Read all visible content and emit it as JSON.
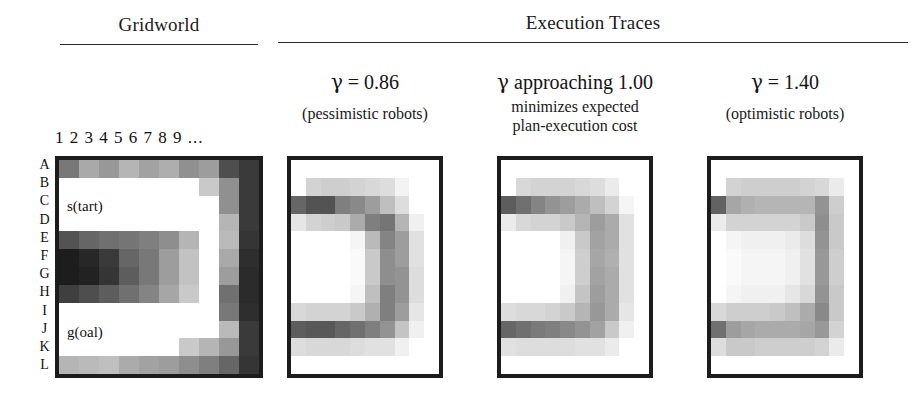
{
  "headings": {
    "gridworld": "Gridworld",
    "traces": "Execution Traces"
  },
  "gridworld": {
    "column_header": "1 2 3 4 5 6 7 8 9 ...",
    "row_labels": [
      "A",
      "B",
      "C",
      "D",
      "E",
      "F",
      "G",
      "H",
      "I",
      "J",
      "K",
      "L"
    ],
    "start_label": "s(tart)",
    "goal_label": "g(oal)",
    "columns": 10,
    "rows": 12,
    "grid": [
      [
        0.55,
        0.35,
        0.42,
        0.3,
        0.38,
        0.33,
        0.45,
        0.4,
        0.72,
        0.8
      ],
      [
        0.0,
        0.0,
        0.0,
        0.0,
        0.0,
        0.0,
        0.0,
        0.22,
        0.45,
        0.8
      ],
      [
        0.0,
        0.0,
        0.0,
        0.0,
        0.0,
        0.0,
        0.0,
        0.0,
        0.45,
        0.8
      ],
      [
        0.0,
        0.0,
        0.0,
        0.0,
        0.0,
        0.0,
        0.0,
        0.0,
        0.3,
        0.8
      ],
      [
        0.7,
        0.62,
        0.58,
        0.56,
        0.52,
        0.46,
        0.3,
        0.0,
        0.28,
        0.82
      ],
      [
        0.92,
        0.88,
        0.8,
        0.62,
        0.55,
        0.4,
        0.25,
        0.0,
        0.35,
        0.85
      ],
      [
        0.92,
        0.9,
        0.82,
        0.66,
        0.55,
        0.4,
        0.25,
        0.0,
        0.4,
        0.86
      ],
      [
        0.78,
        0.72,
        0.66,
        0.58,
        0.5,
        0.36,
        0.22,
        0.0,
        0.58,
        0.86
      ],
      [
        0.0,
        0.0,
        0.0,
        0.0,
        0.0,
        0.0,
        0.0,
        0.0,
        0.55,
        0.85
      ],
      [
        0.0,
        0.0,
        0.0,
        0.0,
        0.0,
        0.0,
        0.0,
        0.0,
        0.28,
        0.8
      ],
      [
        0.0,
        0.0,
        0.0,
        0.0,
        0.0,
        0.0,
        0.22,
        0.3,
        0.42,
        0.8
      ],
      [
        0.3,
        0.28,
        0.26,
        0.34,
        0.38,
        0.4,
        0.46,
        0.52,
        0.62,
        0.82
      ]
    ]
  },
  "traces": [
    {
      "gamma_symbol": "γ",
      "gamma_text": " =  0.86",
      "caption": "(pessimistic robots)",
      "columns": 10,
      "rows": 12,
      "grid": [
        [
          0.0,
          0.0,
          0.0,
          0.0,
          0.0,
          0.0,
          0.0,
          0.0,
          0.0,
          0.0
        ],
        [
          0.0,
          0.18,
          0.2,
          0.2,
          0.18,
          0.16,
          0.14,
          0.05,
          0.0,
          0.0
        ],
        [
          0.62,
          0.7,
          0.7,
          0.52,
          0.48,
          0.4,
          0.26,
          0.14,
          0.0,
          0.0
        ],
        [
          0.1,
          0.18,
          0.2,
          0.22,
          0.34,
          0.52,
          0.56,
          0.3,
          0.06,
          0.0
        ],
        [
          0.0,
          0.0,
          0.0,
          0.0,
          0.04,
          0.28,
          0.5,
          0.4,
          0.12,
          0.0
        ],
        [
          0.0,
          0.0,
          0.0,
          0.0,
          0.02,
          0.22,
          0.46,
          0.4,
          0.12,
          0.0
        ],
        [
          0.0,
          0.0,
          0.0,
          0.0,
          0.02,
          0.22,
          0.46,
          0.44,
          0.14,
          0.0
        ],
        [
          0.0,
          0.0,
          0.0,
          0.0,
          0.04,
          0.26,
          0.52,
          0.44,
          0.14,
          0.0
        ],
        [
          0.16,
          0.18,
          0.18,
          0.18,
          0.22,
          0.32,
          0.52,
          0.4,
          0.1,
          0.0
        ],
        [
          0.66,
          0.68,
          0.68,
          0.62,
          0.58,
          0.52,
          0.44,
          0.24,
          0.06,
          0.0
        ],
        [
          0.14,
          0.16,
          0.16,
          0.16,
          0.14,
          0.12,
          0.12,
          0.06,
          0.0,
          0.0
        ],
        [
          0.0,
          0.0,
          0.0,
          0.0,
          0.0,
          0.0,
          0.0,
          0.0,
          0.0,
          0.0
        ]
      ]
    },
    {
      "gamma_symbol": "γ",
      "gamma_text": " approaching 1.00",
      "caption_line1": "minimizes expected",
      "caption_line2": "plan-execution cost",
      "columns": 10,
      "rows": 12,
      "grid": [
        [
          0.0,
          0.0,
          0.0,
          0.0,
          0.0,
          0.0,
          0.0,
          0.0,
          0.0,
          0.0
        ],
        [
          0.0,
          0.16,
          0.18,
          0.18,
          0.18,
          0.16,
          0.14,
          0.08,
          0.0,
          0.0
        ],
        [
          0.66,
          0.58,
          0.5,
          0.44,
          0.4,
          0.34,
          0.26,
          0.18,
          0.04,
          0.0
        ],
        [
          0.08,
          0.16,
          0.18,
          0.18,
          0.22,
          0.3,
          0.4,
          0.34,
          0.12,
          0.0
        ],
        [
          0.0,
          0.0,
          0.0,
          0.0,
          0.06,
          0.22,
          0.38,
          0.34,
          0.12,
          0.0
        ],
        [
          0.0,
          0.0,
          0.0,
          0.0,
          0.04,
          0.2,
          0.36,
          0.32,
          0.12,
          0.0
        ],
        [
          0.0,
          0.0,
          0.0,
          0.0,
          0.04,
          0.2,
          0.38,
          0.34,
          0.12,
          0.0
        ],
        [
          0.0,
          0.0,
          0.0,
          0.0,
          0.06,
          0.24,
          0.4,
          0.34,
          0.12,
          0.0
        ],
        [
          0.14,
          0.16,
          0.16,
          0.18,
          0.22,
          0.3,
          0.42,
          0.34,
          0.1,
          0.0
        ],
        [
          0.62,
          0.58,
          0.54,
          0.52,
          0.48,
          0.44,
          0.38,
          0.22,
          0.06,
          0.0
        ],
        [
          0.12,
          0.14,
          0.14,
          0.14,
          0.14,
          0.12,
          0.12,
          0.08,
          0.0,
          0.0
        ],
        [
          0.0,
          0.0,
          0.0,
          0.0,
          0.0,
          0.0,
          0.0,
          0.0,
          0.0,
          0.0
        ]
      ]
    },
    {
      "gamma_symbol": "γ",
      "gamma_text": " =  1.40",
      "caption": "(optimistic robots)",
      "columns": 10,
      "rows": 12,
      "grid": [
        [
          0.0,
          0.0,
          0.0,
          0.0,
          0.0,
          0.0,
          0.0,
          0.0,
          0.0,
          0.0
        ],
        [
          0.0,
          0.18,
          0.2,
          0.2,
          0.2,
          0.2,
          0.18,
          0.16,
          0.08,
          0.0
        ],
        [
          0.64,
          0.36,
          0.32,
          0.3,
          0.3,
          0.3,
          0.3,
          0.44,
          0.2,
          0.0
        ],
        [
          0.08,
          0.18,
          0.18,
          0.18,
          0.18,
          0.18,
          0.22,
          0.46,
          0.22,
          0.0
        ],
        [
          0.0,
          0.04,
          0.06,
          0.06,
          0.06,
          0.08,
          0.14,
          0.44,
          0.22,
          0.0
        ],
        [
          0.0,
          0.02,
          0.04,
          0.04,
          0.04,
          0.06,
          0.12,
          0.42,
          0.2,
          0.0
        ],
        [
          0.0,
          0.02,
          0.04,
          0.04,
          0.04,
          0.06,
          0.12,
          0.42,
          0.2,
          0.0
        ],
        [
          0.0,
          0.04,
          0.06,
          0.06,
          0.06,
          0.1,
          0.16,
          0.44,
          0.22,
          0.0
        ],
        [
          0.16,
          0.2,
          0.2,
          0.2,
          0.22,
          0.26,
          0.34,
          0.48,
          0.22,
          0.0
        ],
        [
          0.58,
          0.4,
          0.36,
          0.34,
          0.34,
          0.34,
          0.36,
          0.42,
          0.18,
          0.0
        ],
        [
          0.14,
          0.22,
          0.22,
          0.2,
          0.2,
          0.2,
          0.2,
          0.18,
          0.08,
          0.0
        ],
        [
          0.0,
          0.0,
          0.0,
          0.0,
          0.0,
          0.0,
          0.0,
          0.0,
          0.0,
          0.0
        ]
      ]
    }
  ]
}
